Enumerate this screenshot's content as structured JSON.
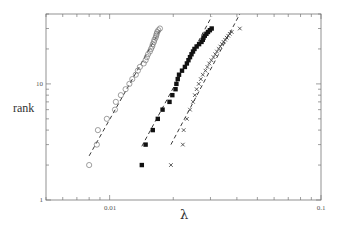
{
  "chart_data": {
    "type": "scatter",
    "title": "",
    "xlabel": "λ",
    "ylabel": "rank",
    "xscale": "log",
    "yscale": "log",
    "xlim": [
      0.005,
      0.1
    ],
    "ylim": [
      1,
      40
    ],
    "grid": false,
    "legend": null,
    "x_tick_labels": [
      {
        "value": 0.01,
        "label": "0.01"
      },
      {
        "value": 0.1,
        "label": "0.1"
      }
    ],
    "y_tick_labels": [
      {
        "value": 1,
        "label": "1"
      },
      {
        "value": 10,
        "label": "10"
      }
    ],
    "series": [
      {
        "name": "open circles",
        "marker": "circle-open",
        "points": [
          [
            0.008,
            2
          ],
          [
            0.0087,
            3
          ],
          [
            0.0088,
            4
          ],
          [
            0.0097,
            5
          ],
          [
            0.0106,
            6
          ],
          [
            0.0107,
            7
          ],
          [
            0.0113,
            8
          ],
          [
            0.0119,
            9
          ],
          [
            0.0124,
            10
          ],
          [
            0.0128,
            11
          ],
          [
            0.0133,
            12
          ],
          [
            0.0136,
            13
          ],
          [
            0.0139,
            14
          ],
          [
            0.0145,
            15
          ],
          [
            0.0148,
            16
          ],
          [
            0.015,
            17
          ],
          [
            0.0152,
            18
          ],
          [
            0.0155,
            19
          ],
          [
            0.0157,
            20
          ],
          [
            0.0159,
            21
          ],
          [
            0.016,
            22
          ],
          [
            0.0162,
            23
          ],
          [
            0.0163,
            24
          ],
          [
            0.0165,
            25
          ],
          [
            0.0166,
            26
          ],
          [
            0.0167,
            27
          ],
          [
            0.0168,
            28
          ],
          [
            0.017,
            29
          ],
          [
            0.0173,
            30
          ]
        ],
        "fit_line": [
          [
            0.008,
            2.4
          ],
          [
            0.0173,
            29.0
          ]
        ]
      },
      {
        "name": "filled squares",
        "marker": "square-filled",
        "points": [
          [
            0.0142,
            2
          ],
          [
            0.0148,
            3
          ],
          [
            0.016,
            4
          ],
          [
            0.0169,
            5
          ],
          [
            0.0178,
            6
          ],
          [
            0.0192,
            7
          ],
          [
            0.0198,
            8
          ],
          [
            0.0205,
            9
          ],
          [
            0.0207,
            10
          ],
          [
            0.021,
            11
          ],
          [
            0.0213,
            12
          ],
          [
            0.022,
            13
          ],
          [
            0.0227,
            14
          ],
          [
            0.0232,
            15
          ],
          [
            0.0236,
            16
          ],
          [
            0.024,
            17
          ],
          [
            0.0244,
            18
          ],
          [
            0.0248,
            19
          ],
          [
            0.0252,
            20
          ],
          [
            0.0258,
            21
          ],
          [
            0.0265,
            22
          ],
          [
            0.0272,
            23
          ],
          [
            0.0276,
            24
          ],
          [
            0.0278,
            25
          ],
          [
            0.0282,
            26
          ],
          [
            0.0287,
            27
          ],
          [
            0.0292,
            28
          ],
          [
            0.0298,
            29
          ],
          [
            0.0304,
            30
          ]
        ],
        "fit_line": [
          [
            0.0142,
            2.9
          ],
          [
            0.0304,
            38.0
          ]
        ]
      },
      {
        "name": "crosses",
        "marker": "x",
        "points": [
          [
            0.0195,
            2
          ],
          [
            0.0222,
            3
          ],
          [
            0.0224,
            4
          ],
          [
            0.0232,
            5
          ],
          [
            0.024,
            6
          ],
          [
            0.0248,
            7
          ],
          [
            0.0253,
            8
          ],
          [
            0.0258,
            9
          ],
          [
            0.0264,
            10
          ],
          [
            0.027,
            11
          ],
          [
            0.0276,
            12
          ],
          [
            0.0284,
            13
          ],
          [
            0.029,
            14
          ],
          [
            0.0296,
            15
          ],
          [
            0.0303,
            16
          ],
          [
            0.031,
            17
          ],
          [
            0.0316,
            18
          ],
          [
            0.0322,
            19
          ],
          [
            0.0328,
            20
          ],
          [
            0.0334,
            21
          ],
          [
            0.034,
            22
          ],
          [
            0.0346,
            23
          ],
          [
            0.0352,
            24
          ],
          [
            0.0358,
            25
          ],
          [
            0.0364,
            26
          ],
          [
            0.037,
            27
          ],
          [
            0.0378,
            28
          ],
          [
            0.0413,
            30
          ]
        ],
        "fit_line": [
          [
            0.0195,
            3.0
          ],
          [
            0.0413,
            40.0
          ]
        ]
      }
    ]
  },
  "axes": {
    "xlabel": "λ",
    "ylabel": "rank",
    "x_ticks": [
      "0.01",
      "0.1"
    ],
    "y_ticks": [
      "1",
      "10"
    ]
  }
}
